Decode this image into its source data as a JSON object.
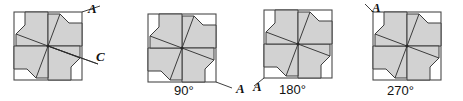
{
  "figure": {
    "kind": "rotational-symmetry-diagram",
    "colors": {
      "shaded_fill": "#d2d2d2",
      "background_fill": "#ffffff",
      "outline": "#3c3c3c",
      "border": "#4a4a4a",
      "text": "#121212"
    },
    "panels": [
      {
        "id": "panel-original",
        "angle_label": "",
        "vertex_labels": [
          {
            "name": "A",
            "text": "A",
            "position": "top-right-outside"
          },
          {
            "name": "C",
            "text": "C",
            "position": "right-middle-outside"
          }
        ],
        "has_pointer_to_center": true
      },
      {
        "id": "panel-90",
        "angle_label": "90°",
        "vertex_labels": [
          {
            "name": "A",
            "text": "A",
            "position": "bottom-right-outside"
          }
        ],
        "has_pointer_to_center": false
      },
      {
        "id": "panel-180",
        "angle_label": "180°",
        "vertex_labels": [
          {
            "name": "A",
            "text": "A",
            "position": "bottom-left-outside"
          }
        ],
        "has_pointer_to_center": false
      },
      {
        "id": "panel-270",
        "angle_label": "270°",
        "vertex_labels": [
          {
            "name": "A",
            "text": "A",
            "position": "top-left-outside"
          }
        ],
        "has_pointer_to_center": false
      }
    ]
  }
}
